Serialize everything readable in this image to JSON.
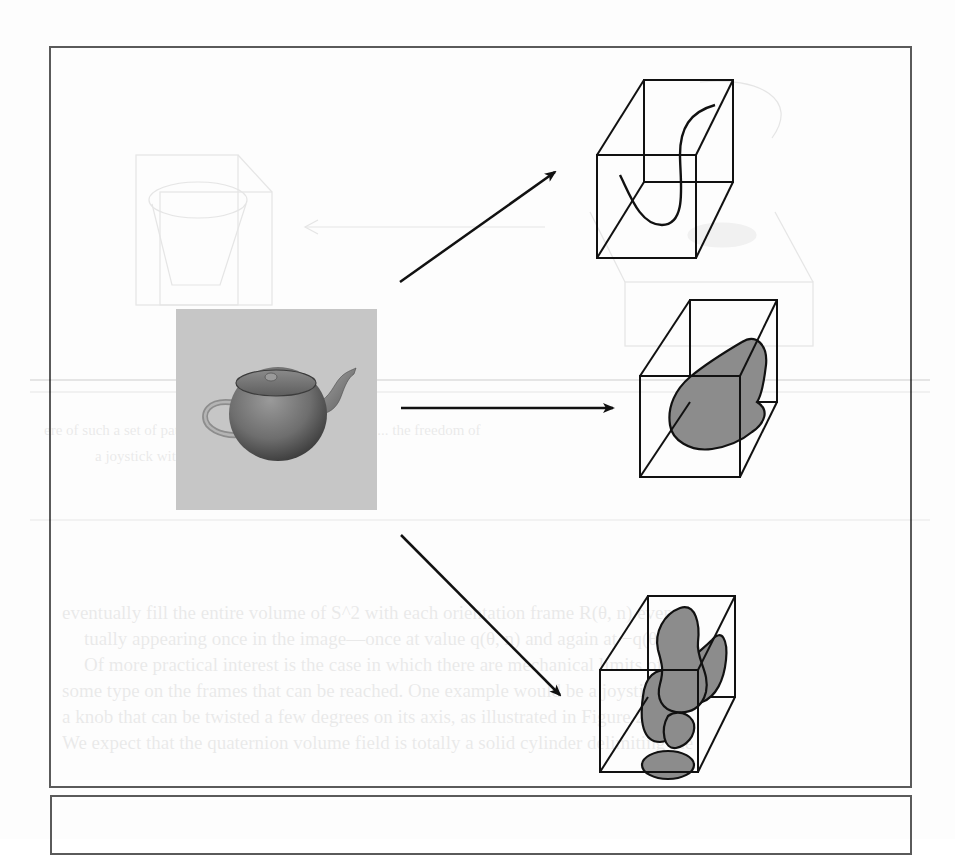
{
  "figure": {
    "source_image": {
      "label": "teapot-render",
      "background_color": "#c8c8c8"
    },
    "arrows": [
      {
        "name": "arrow-to-curve-volume",
        "direction": "up-right"
      },
      {
        "name": "arrow-to-blob-volume",
        "direction": "right"
      },
      {
        "name": "arrow-to-multiblob-volume",
        "direction": "down-right"
      }
    ],
    "volumes": [
      {
        "name": "curve-volume",
        "content": "curve"
      },
      {
        "name": "blob-volume",
        "content": "single-blob"
      },
      {
        "name": "multiblob-volume",
        "content": "multiple-blobs"
      }
    ],
    "colors": {
      "frame": "#5a5a5a",
      "stroke": "#111111",
      "blob_fill": "#8c8c8c",
      "teapot_bg": "#c6c6c6"
    }
  },
  "bleed_through": {
    "caption_line_1": "ere of such a set of patterns in volume containing its of ...  the freedom of",
    "caption_line_2": "a joystick with a movable handle.",
    "body_lines": [
      "eventually fill the entire volume of S^2 with each orientation frame R(θ, n) even-",
      "tually appearing once in the image—once at value q(θ, n) and again at −q(θ, n).",
      "Of more practical interest is the case in which there are mechanical limits of",
      "some type on the frames that can be reached. One example would be a joystick with",
      "a knob that can be twisted a few degrees on its axis, as illustrated in Figure 23.3.",
      "We expect that the quaternion volume field is totally a solid cylinder delimiting the"
    ]
  }
}
